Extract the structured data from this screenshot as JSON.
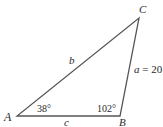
{
  "diagram": {
    "type": "triangle",
    "stroke_color": "#555555",
    "text_color": "#2a2a2a",
    "vertices": [
      {
        "name": "A",
        "x": 17,
        "y": 116
      },
      {
        "name": "B",
        "x": 120,
        "y": 116
      },
      {
        "name": "C",
        "x": 139,
        "y": 18
      }
    ],
    "vertex_labels": {
      "A": "A",
      "B": "B",
      "C": "C"
    },
    "side_labels": {
      "a": "a = 20",
      "b": "b",
      "c": "c"
    },
    "angle_labels": {
      "A": "38°",
      "B": "102°"
    }
  }
}
